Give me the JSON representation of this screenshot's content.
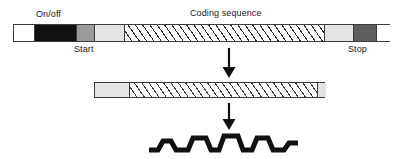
{
  "figure": {
    "background_color": "#ffffff",
    "width": 403,
    "height": 159
  },
  "labels": {
    "on_off": "On/off",
    "start": "Start",
    "stop": "Stop",
    "coding_sequence": "Coding sequence"
  },
  "colors": {
    "outline": "#3d3d3d",
    "black_segment": "#111111",
    "mid_gray_segment": "#9a9a9a",
    "light_gray_segment": "#e3e3e3",
    "dark_gray_segment": "#5e5e5e",
    "white_segment": "#ffffff",
    "hatch_line": "#2b2b2b",
    "arrow": "#111111",
    "protein": "#111111",
    "text": "#1a1a1a"
  },
  "gene_bar": {
    "name": "gene-bar",
    "x": 13,
    "y": 24,
    "width": 377,
    "height": 18,
    "segments": [
      {
        "name": "upstream-white-region",
        "fill": "white",
        "x": 0,
        "width": 20
      },
      {
        "name": "on-off-region",
        "fill": "black",
        "x": 20,
        "width": 42
      },
      {
        "name": "start-region",
        "fill": "midgray",
        "x": 62,
        "width": 18
      },
      {
        "name": "leader-region",
        "fill": "lightgray",
        "x": 80,
        "width": 30
      },
      {
        "name": "coding-sequence-region",
        "fill": "hatch",
        "x": 110,
        "width": 200
      },
      {
        "name": "trailer-region",
        "fill": "lightgray",
        "x": 310,
        "width": 29
      },
      {
        "name": "stop-region",
        "fill": "darkgray",
        "x": 339,
        "width": 23
      },
      {
        "name": "downstream-white-region",
        "fill": "white",
        "x": 362,
        "width": 15
      }
    ]
  },
  "transcript_bar": {
    "name": "transcript-bar",
    "x": 94,
    "y": 82,
    "width": 231,
    "height": 16,
    "segments": [
      {
        "name": "transcript-leader",
        "fill": "lightgray",
        "x": 0,
        "width": 34
      },
      {
        "name": "transcript-coding",
        "fill": "hatch",
        "x": 34,
        "width": 188
      },
      {
        "name": "transcript-trailer",
        "fill": "lightgray",
        "x": 222,
        "width": 9
      }
    ]
  },
  "arrows": [
    {
      "name": "transcription-arrow",
      "x": 228,
      "y_top": 48,
      "y_bottom": 77
    },
    {
      "name": "translation-arrow",
      "x": 228,
      "y_top": 104,
      "y_bottom": 129
    }
  ],
  "protein": {
    "name": "protein-chain",
    "x": 148,
    "y": 133,
    "width": 150,
    "height": 20,
    "stroke_width": 5
  },
  "label_positions": {
    "on_off": {
      "x": 36,
      "y": 9
    },
    "coding_sequence": {
      "x": 190,
      "y": 8
    },
    "start": {
      "x": 74,
      "y": 44
    },
    "stop": {
      "x": 348,
      "y": 44
    }
  }
}
